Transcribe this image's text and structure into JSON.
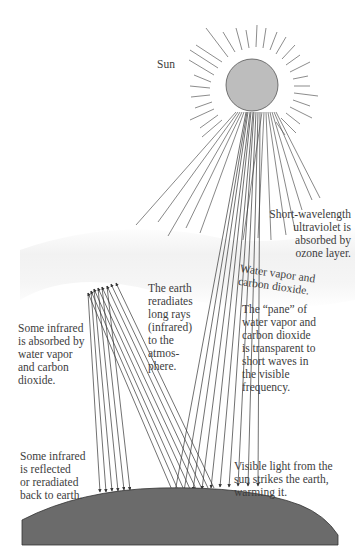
{
  "diagram": {
    "colors": {
      "background": "#ffffff",
      "sun_fill": "#bdbdbd",
      "earth_fill": "#6b6b6b",
      "atmosphere_haze": "#f0f0f0",
      "line": "#4a4a4a",
      "text": "#3d3d3d"
    },
    "labels": {
      "sun": "Sun",
      "ozone": "Short-wavelength\nultraviolet is\nabsorbed by\nozone layer.",
      "water_vapor": "Water vapor and\ncarbon dioxide.",
      "pane": "The “pane” of\nwater vapor and\ncarbon dioxide\nis transparent to\nshort waves in\nthe visible\nfrequency.",
      "reradiates": "The earth\nreradiates\nlong rays\n(infrared)\nto the\natmos-\nphere.",
      "absorbed": "Some infrared\nis absorbed by\nwater vapor\nand carbon\ndioxide.",
      "reflected": "Some infrared\nis reflected\nor reradiated\nback to earth.",
      "visible": "Visible light from the\nsun strikes the earth,\nwarming it."
    }
  }
}
